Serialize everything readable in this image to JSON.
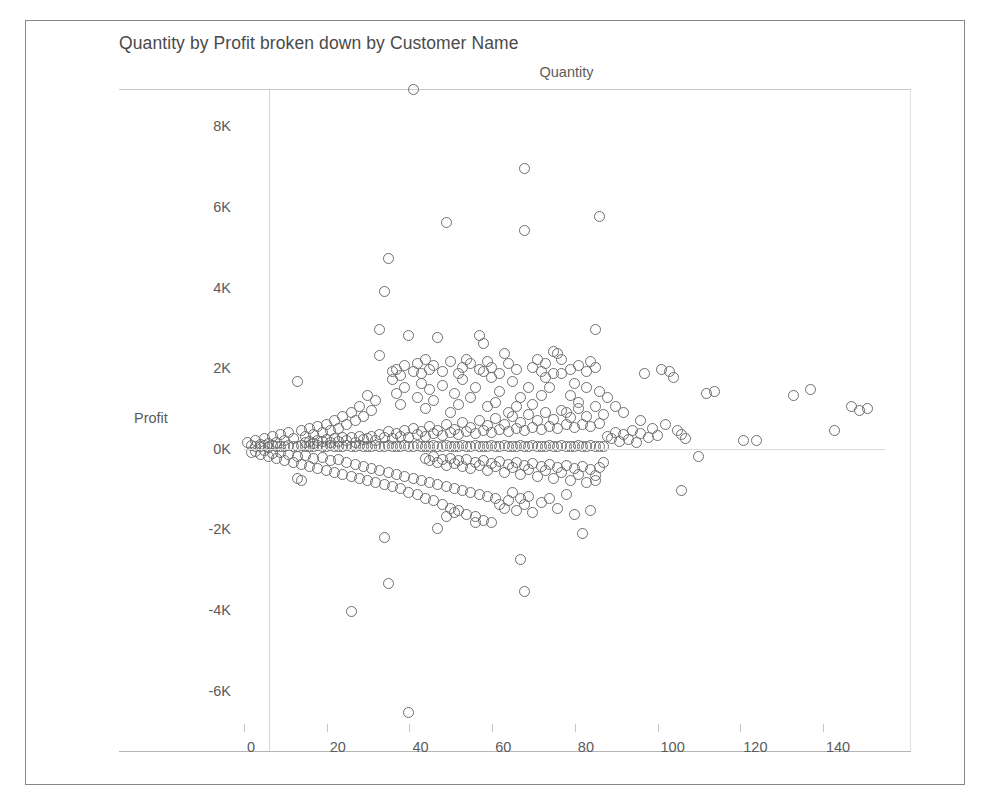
{
  "card": {
    "border_color": "#868686",
    "background": "#ffffff"
  },
  "chart_data": {
    "type": "scatter",
    "title": "Quantity by Profit broken down by Customer Name",
    "xlabel": "Quantity",
    "ylabel": "Profit",
    "xlim": [
      0,
      155
    ],
    "ylim": [
      -7000,
      9400
    ],
    "grid": false,
    "legend": "none",
    "marker": {
      "shape": "open-circle",
      "stroke_color": "#6e6e70",
      "fill": "none",
      "diameter_px": 12
    },
    "xticks": [
      0,
      20,
      40,
      60,
      80,
      100,
      120,
      140
    ],
    "xtick_labels": [
      "0",
      "20",
      "40",
      "60",
      "80",
      "100",
      "120",
      "140"
    ],
    "yticks": [
      8000,
      6000,
      4000,
      2000,
      0,
      -2000,
      -4000,
      -6000
    ],
    "ytick_labels": [
      "8K",
      "6K",
      "4K",
      "2K",
      "0K",
      "-2K",
      "-4K",
      "-6K"
    ],
    "axis_label_color": "#5b5b5b",
    "title_color": "#4a4a4a",
    "points": [
      [
        41,
        8900
      ],
      [
        68,
        6950
      ],
      [
        49,
        5600
      ],
      [
        68,
        5400
      ],
      [
        86,
        5750
      ],
      [
        35,
        4700
      ],
      [
        34,
        3900
      ],
      [
        40,
        2800
      ],
      [
        33,
        2950
      ],
      [
        47,
        2750
      ],
      [
        57,
        2800
      ],
      [
        58,
        2600
      ],
      [
        63,
        2350
      ],
      [
        75,
        2400
      ],
      [
        85,
        2950
      ],
      [
        76,
        2350
      ],
      [
        71,
        2200
      ],
      [
        54,
        2200
      ],
      [
        57,
        1950
      ],
      [
        33,
        2300
      ],
      [
        13,
        1650
      ],
      [
        84,
        2150
      ],
      [
        97,
        1850
      ],
      [
        101,
        1950
      ],
      [
        103,
        1900
      ],
      [
        104,
        1750
      ],
      [
        112,
        1350
      ],
      [
        114,
        1400
      ],
      [
        133,
        1300
      ],
      [
        137,
        1450
      ],
      [
        149,
        950
      ],
      [
        147,
        1050
      ],
      [
        151,
        1000
      ],
      [
        143,
        450
      ],
      [
        121,
        200
      ],
      [
        124,
        200
      ],
      [
        106,
        350
      ],
      [
        106,
        -1050
      ],
      [
        110,
        -200
      ],
      [
        96,
        700
      ],
      [
        92,
        900
      ],
      [
        90,
        1050
      ],
      [
        88,
        1250
      ],
      [
        86,
        1400
      ],
      [
        83,
        1500
      ],
      [
        81,
        1150
      ],
      [
        80,
        1600
      ],
      [
        79,
        1300
      ],
      [
        78,
        900
      ],
      [
        77,
        1850
      ],
      [
        74,
        1500
      ],
      [
        73,
        1750
      ],
      [
        72,
        1300
      ],
      [
        70,
        1100
      ],
      [
        69,
        1500
      ],
      [
        67,
        1250
      ],
      [
        66,
        1050
      ],
      [
        65,
        1650
      ],
      [
        64,
        900
      ],
      [
        62,
        1400
      ],
      [
        61,
        1150
      ],
      [
        60,
        1750
      ],
      [
        59,
        1050
      ],
      [
        56,
        1500
      ],
      [
        55,
        1250
      ],
      [
        53,
        1700
      ],
      [
        52,
        1100
      ],
      [
        51,
        1350
      ],
      [
        50,
        900
      ],
      [
        48,
        1550
      ],
      [
        46,
        1200
      ],
      [
        45,
        1450
      ],
      [
        44,
        1000
      ],
      [
        43,
        1600
      ],
      [
        42,
        1250
      ],
      [
        39,
        1500
      ],
      [
        38,
        1100
      ],
      [
        37,
        1350
      ],
      [
        36,
        1700
      ],
      [
        32,
        1200
      ],
      [
        31,
        950
      ],
      [
        30,
        1300
      ],
      [
        29,
        800
      ],
      [
        28,
        1050
      ],
      [
        27,
        700
      ],
      [
        26,
        900
      ],
      [
        25,
        600
      ],
      [
        24,
        800
      ],
      [
        23,
        500
      ],
      [
        22,
        700
      ],
      [
        21,
        450
      ],
      [
        20,
        600
      ],
      [
        19,
        400
      ],
      [
        18,
        550
      ],
      [
        17,
        350
      ],
      [
        16,
        500
      ],
      [
        15,
        300
      ],
      [
        14,
        450
      ],
      [
        12,
        250
      ],
      [
        11,
        400
      ],
      [
        10,
        200
      ],
      [
        9,
        350
      ],
      [
        8,
        150
      ],
      [
        7,
        300
      ],
      [
        6,
        120
      ],
      [
        5,
        250
      ],
      [
        4,
        100
      ],
      [
        3,
        200
      ],
      [
        2,
        80
      ],
      [
        1,
        150
      ],
      [
        2,
        -100
      ],
      [
        3,
        -80
      ],
      [
        4,
        -150
      ],
      [
        5,
        -60
      ],
      [
        6,
        -200
      ],
      [
        7,
        -120
      ],
      [
        8,
        -250
      ],
      [
        9,
        -100
      ],
      [
        10,
        -300
      ],
      [
        11,
        -150
      ],
      [
        12,
        -350
      ],
      [
        13,
        -200
      ],
      [
        14,
        -400
      ],
      [
        15,
        -180
      ],
      [
        16,
        -450
      ],
      [
        17,
        -250
      ],
      [
        18,
        -500
      ],
      [
        19,
        -220
      ],
      [
        20,
        -550
      ],
      [
        21,
        -300
      ],
      [
        22,
        -600
      ],
      [
        23,
        -280
      ],
      [
        24,
        -650
      ],
      [
        25,
        -350
      ],
      [
        26,
        -700
      ],
      [
        13,
        -750
      ],
      [
        14,
        -800
      ],
      [
        27,
        -400
      ],
      [
        28,
        -750
      ],
      [
        29,
        -450
      ],
      [
        30,
        -800
      ],
      [
        31,
        -500
      ],
      [
        32,
        -850
      ],
      [
        33,
        -550
      ],
      [
        34,
        -900
      ],
      [
        35,
        -600
      ],
      [
        36,
        -950
      ],
      [
        37,
        -650
      ],
      [
        38,
        -1000
      ],
      [
        39,
        -700
      ],
      [
        40,
        -1100
      ],
      [
        41,
        -750
      ],
      [
        42,
        -1150
      ],
      [
        43,
        -800
      ],
      [
        44,
        -1250
      ],
      [
        45,
        -850
      ],
      [
        46,
        -1300
      ],
      [
        47,
        -900
      ],
      [
        48,
        -1400
      ],
      [
        49,
        -950
      ],
      [
        50,
        -1500
      ],
      [
        51,
        -1000
      ],
      [
        52,
        -1550
      ],
      [
        53,
        -1050
      ],
      [
        54,
        -1650
      ],
      [
        55,
        -1100
      ],
      [
        56,
        -1700
      ],
      [
        57,
        -1150
      ],
      [
        58,
        -1800
      ],
      [
        59,
        -1200
      ],
      [
        60,
        -1850
      ],
      [
        61,
        -1250
      ],
      [
        62,
        -1400
      ],
      [
        63,
        -1500
      ],
      [
        64,
        -1300
      ],
      [
        65,
        -1100
      ],
      [
        66,
        -1550
      ],
      [
        67,
        -1250
      ],
      [
        68,
        -1400
      ],
      [
        69,
        -1200
      ],
      [
        70,
        -1600
      ],
      [
        72,
        -1350
      ],
      [
        74,
        -1250
      ],
      [
        76,
        -1500
      ],
      [
        78,
        -1150
      ],
      [
        80,
        -1650
      ],
      [
        82,
        -2100
      ],
      [
        84,
        -1550
      ],
      [
        85,
        -800
      ],
      [
        87,
        -350
      ],
      [
        34,
        -2200
      ],
      [
        47,
        -2000
      ],
      [
        49,
        -1700
      ],
      [
        51,
        -1600
      ],
      [
        56,
        -1850
      ],
      [
        67,
        -2750
      ],
      [
        68,
        -3550
      ],
      [
        35,
        -3350
      ],
      [
        26,
        -4050
      ],
      [
        40,
        -6550
      ],
      [
        36,
        1900
      ],
      [
        37,
        1950
      ],
      [
        38,
        1800
      ],
      [
        39,
        2050
      ],
      [
        41,
        1900
      ],
      [
        42,
        2100
      ],
      [
        43,
        1850
      ],
      [
        44,
        2200
      ],
      [
        45,
        1950
      ],
      [
        46,
        2050
      ],
      [
        48,
        1900
      ],
      [
        50,
        2150
      ],
      [
        52,
        1850
      ],
      [
        53,
        2000
      ],
      [
        55,
        2100
      ],
      [
        58,
        1900
      ],
      [
        59,
        2150
      ],
      [
        60,
        2000
      ],
      [
        62,
        1850
      ],
      [
        64,
        2100
      ],
      [
        66,
        1950
      ],
      [
        70,
        2000
      ],
      [
        72,
        1900
      ],
      [
        73,
        2100
      ],
      [
        75,
        1850
      ],
      [
        77,
        2200
      ],
      [
        79,
        1950
      ],
      [
        81,
        2050
      ],
      [
        83,
        1900
      ],
      [
        85,
        2000
      ],
      [
        3,
        50
      ],
      [
        4,
        40
      ],
      [
        5,
        60
      ],
      [
        6,
        30
      ],
      [
        7,
        70
      ],
      [
        8,
        45
      ],
      [
        9,
        55
      ],
      [
        10,
        35
      ],
      [
        11,
        65
      ],
      [
        12,
        50
      ],
      [
        13,
        40
      ],
      [
        14,
        60
      ],
      [
        15,
        45
      ],
      [
        16,
        55
      ],
      [
        17,
        35
      ],
      [
        18,
        65
      ],
      [
        19,
        50
      ],
      [
        20,
        40
      ],
      [
        21,
        60
      ],
      [
        22,
        45
      ],
      [
        23,
        55
      ],
      [
        24,
        35
      ],
      [
        25,
        65
      ],
      [
        26,
        50
      ],
      [
        27,
        40
      ],
      [
        28,
        60
      ],
      [
        29,
        45
      ],
      [
        30,
        55
      ],
      [
        31,
        35
      ],
      [
        32,
        65
      ],
      [
        33,
        50
      ],
      [
        34,
        40
      ],
      [
        35,
        60
      ],
      [
        36,
        45
      ],
      [
        37,
        55
      ],
      [
        38,
        35
      ],
      [
        39,
        65
      ],
      [
        40,
        50
      ],
      [
        41,
        40
      ],
      [
        42,
        60
      ],
      [
        43,
        45
      ],
      [
        44,
        55
      ],
      [
        45,
        35
      ],
      [
        46,
        65
      ],
      [
        47,
        50
      ],
      [
        48,
        40
      ],
      [
        49,
        60
      ],
      [
        50,
        45
      ],
      [
        51,
        55
      ],
      [
        52,
        35
      ],
      [
        53,
        65
      ],
      [
        54,
        50
      ],
      [
        55,
        40
      ],
      [
        56,
        60
      ],
      [
        57,
        45
      ],
      [
        58,
        55
      ],
      [
        59,
        35
      ],
      [
        60,
        65
      ],
      [
        61,
        50
      ],
      [
        62,
        40
      ],
      [
        63,
        60
      ],
      [
        64,
        45
      ],
      [
        65,
        55
      ],
      [
        66,
        35
      ],
      [
        67,
        65
      ],
      [
        68,
        50
      ],
      [
        69,
        40
      ],
      [
        70,
        60
      ],
      [
        71,
        45
      ],
      [
        72,
        55
      ],
      [
        73,
        35
      ],
      [
        74,
        65
      ],
      [
        75,
        50
      ],
      [
        76,
        40
      ],
      [
        77,
        60
      ],
      [
        78,
        45
      ],
      [
        79,
        55
      ],
      [
        80,
        35
      ],
      [
        81,
        65
      ],
      [
        82,
        50
      ],
      [
        83,
        40
      ],
      [
        84,
        60
      ],
      [
        85,
        45
      ],
      [
        86,
        55
      ],
      [
        87,
        35
      ],
      [
        88,
        300
      ],
      [
        89,
        250
      ],
      [
        90,
        400
      ],
      [
        91,
        180
      ],
      [
        92,
        350
      ],
      [
        93,
        220
      ],
      [
        94,
        450
      ],
      [
        95,
        150
      ],
      [
        96,
        380
      ],
      [
        98,
        280
      ],
      [
        99,
        500
      ],
      [
        100,
        320
      ],
      [
        102,
        600
      ],
      [
        105,
        450
      ],
      [
        107,
        250
      ],
      [
        30,
        250
      ],
      [
        31,
        300
      ],
      [
        32,
        200
      ],
      [
        33,
        350
      ],
      [
        34,
        280
      ],
      [
        35,
        420
      ],
      [
        36,
        250
      ],
      [
        37,
        380
      ],
      [
        38,
        300
      ],
      [
        39,
        450
      ],
      [
        40,
        280
      ],
      [
        41,
        500
      ],
      [
        42,
        350
      ],
      [
        43,
        420
      ],
      [
        44,
        300
      ],
      [
        45,
        550
      ],
      [
        46,
        380
      ],
      [
        47,
        450
      ],
      [
        48,
        320
      ],
      [
        49,
        600
      ],
      [
        50,
        400
      ],
      [
        51,
        480
      ],
      [
        52,
        350
      ],
      [
        53,
        650
      ],
      [
        54,
        420
      ],
      [
        55,
        520
      ],
      [
        56,
        380
      ],
      [
        57,
        700
      ],
      [
        58,
        450
      ],
      [
        59,
        560
      ],
      [
        60,
        400
      ],
      [
        61,
        750
      ],
      [
        62,
        480
      ],
      [
        63,
        600
      ],
      [
        64,
        420
      ],
      [
        65,
        800
      ],
      [
        66,
        500
      ],
      [
        67,
        640
      ],
      [
        68,
        450
      ],
      [
        69,
        850
      ],
      [
        70,
        520
      ],
      [
        71,
        680
      ],
      [
        72,
        470
      ],
      [
        73,
        900
      ],
      [
        74,
        550
      ],
      [
        75,
        720
      ],
      [
        76,
        500
      ],
      [
        77,
        950
      ],
      [
        78,
        580
      ],
      [
        79,
        760
      ],
      [
        80,
        520
      ],
      [
        81,
        1000
      ],
      [
        82,
        600
      ],
      [
        83,
        800
      ],
      [
        84,
        550
      ],
      [
        85,
        1050
      ],
      [
        86,
        620
      ],
      [
        87,
        840
      ],
      [
        15,
        150
      ],
      [
        16,
        180
      ],
      [
        17,
        120
      ],
      [
        18,
        200
      ],
      [
        19,
        160
      ],
      [
        20,
        220
      ],
      [
        21,
        140
      ],
      [
        22,
        240
      ],
      [
        23,
        170
      ],
      [
        24,
        260
      ],
      [
        25,
        190
      ],
      [
        26,
        280
      ],
      [
        27,
        150
      ],
      [
        28,
        300
      ],
      [
        29,
        210
      ],
      [
        44,
        -250
      ],
      [
        45,
        -300
      ],
      [
        46,
        -200
      ],
      [
        47,
        -350
      ],
      [
        48,
        -280
      ],
      [
        49,
        -420
      ],
      [
        50,
        -250
      ],
      [
        51,
        -380
      ],
      [
        52,
        -300
      ],
      [
        53,
        -450
      ],
      [
        54,
        -280
      ],
      [
        55,
        -500
      ],
      [
        56,
        -350
      ],
      [
        57,
        -420
      ],
      [
        58,
        -300
      ],
      [
        59,
        -550
      ],
      [
        60,
        -380
      ],
      [
        61,
        -450
      ],
      [
        62,
        -320
      ],
      [
        63,
        -600
      ],
      [
        64,
        -400
      ],
      [
        65,
        -480
      ],
      [
        66,
        -350
      ],
      [
        67,
        -650
      ],
      [
        68,
        -420
      ],
      [
        69,
        -520
      ],
      [
        70,
        -380
      ],
      [
        71,
        -700
      ],
      [
        72,
        -450
      ],
      [
        73,
        -560
      ],
      [
        74,
        -400
      ],
      [
        75,
        -750
      ],
      [
        76,
        -480
      ],
      [
        77,
        -600
      ],
      [
        78,
        -420
      ],
      [
        79,
        -800
      ],
      [
        80,
        -500
      ],
      [
        81,
        -640
      ],
      [
        82,
        -450
      ],
      [
        83,
        -850
      ],
      [
        84,
        -520
      ],
      [
        85,
        -680
      ],
      [
        86,
        -470
      ]
    ]
  }
}
